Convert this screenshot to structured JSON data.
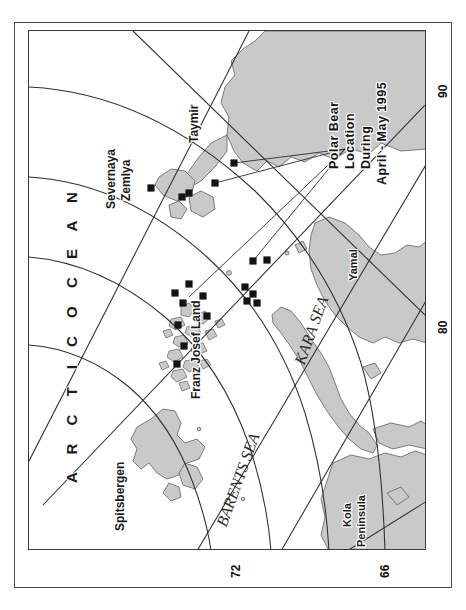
{
  "figure": {
    "kind": "map",
    "orientation_note": "map drawn rotated 90 degrees clockwise; all labels read bottom-to-top",
    "background_color": "#ffffff",
    "land_fill": "#c9c9c9",
    "land_stroke": "#6e6e6e",
    "graticule_color": "#2d2d2d",
    "marker_color": "#141414",
    "frame_color": "#3a3a3a"
  },
  "title": {
    "lines": [
      "Polar Bear",
      "Location",
      "During",
      "April - May 1995"
    ]
  },
  "ocean_label": "A R C T I C   O C E A N",
  "sea_labels": [
    {
      "name": "BARENTS SEA"
    },
    {
      "name": "KARA SEA"
    }
  ],
  "place_labels": [
    {
      "name": "Spitsbergen"
    },
    {
      "name": "Franz Josef Land"
    },
    {
      "name": "Severnaya"
    },
    {
      "name": "Zemlya"
    },
    {
      "name": "Taymir"
    },
    {
      "name": "Yamal"
    },
    {
      "name": "Kola"
    },
    {
      "name": "Peninsula"
    }
  ],
  "axis_labels": [
    {
      "value": "90"
    },
    {
      "value": "80"
    },
    {
      "value": "72"
    },
    {
      "value": "66"
    }
  ],
  "legend": {
    "marker_shape": "square",
    "marker_meaning": "polar bear location"
  },
  "chart_data": {
    "type": "scatter",
    "title": "Polar Bear Location During April - May 1995",
    "xlabel": "",
    "ylabel": "",
    "marker": "filled square",
    "note": "Marker positions given in map-frame pixel coordinates (0,0 = top-left of neatline, 398x520).",
    "points": [
      {
        "x": 160,
        "y": 253
      },
      {
        "x": 146,
        "y": 262
      },
      {
        "x": 174,
        "y": 265
      },
      {
        "x": 154,
        "y": 272
      },
      {
        "x": 178,
        "y": 285
      },
      {
        "x": 149,
        "y": 294
      },
      {
        "x": 155,
        "y": 315
      },
      {
        "x": 148,
        "y": 333
      },
      {
        "x": 224,
        "y": 230
      },
      {
        "x": 238,
        "y": 229
      },
      {
        "x": 216,
        "y": 256
      },
      {
        "x": 224,
        "y": 263
      },
      {
        "x": 218,
        "y": 270
      },
      {
        "x": 228,
        "y": 272
      },
      {
        "x": 205,
        "y": 132
      },
      {
        "x": 186,
        "y": 152
      },
      {
        "x": 160,
        "y": 162
      },
      {
        "x": 153,
        "y": 166
      },
      {
        "x": 122,
        "y": 157
      }
    ]
  }
}
